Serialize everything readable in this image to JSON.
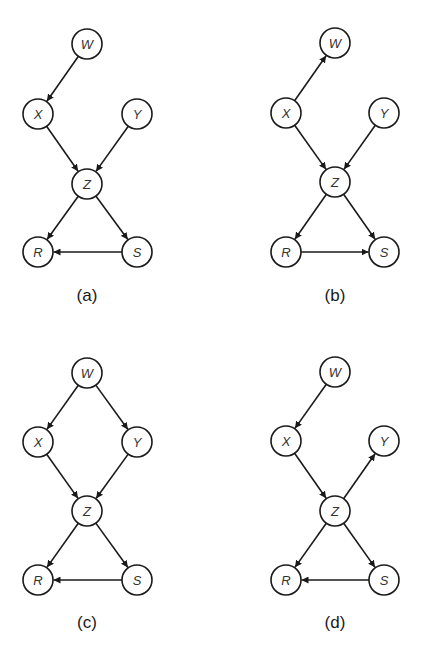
{
  "figure": {
    "node_radius": 15,
    "stroke_color": "#1a1a1a",
    "panels": [
      {
        "label": "(a)",
        "label_pos": [
          87,
          295
        ],
        "nodes": [
          {
            "id": "W",
            "label": "W",
            "x": 87,
            "y": 44
          },
          {
            "id": "X",
            "label": "X",
            "x": 38,
            "y": 114
          },
          {
            "id": "Y",
            "label": "Y",
            "x": 137,
            "y": 114
          },
          {
            "id": "Z",
            "label": "Z",
            "x": 87,
            "y": 184
          },
          {
            "id": "R",
            "label": "R",
            "x": 38,
            "y": 252
          },
          {
            "id": "S",
            "label": "S",
            "x": 137,
            "y": 252
          }
        ],
        "edges": [
          {
            "from": "W",
            "to": "X"
          },
          {
            "from": "X",
            "to": "Z"
          },
          {
            "from": "Y",
            "to": "Z"
          },
          {
            "from": "Z",
            "to": "R"
          },
          {
            "from": "Z",
            "to": "S"
          },
          {
            "from": "S",
            "to": "R"
          }
        ]
      },
      {
        "label": "(b)",
        "label_pos": [
          335,
          295
        ],
        "nodes": [
          {
            "id": "W",
            "label": "W",
            "x": 335,
            "y": 43
          },
          {
            "id": "X",
            "label": "X",
            "x": 286,
            "y": 113
          },
          {
            "id": "Y",
            "label": "Y",
            "x": 384,
            "y": 113
          },
          {
            "id": "Z",
            "label": "Z",
            "x": 335,
            "y": 182
          },
          {
            "id": "R",
            "label": "R",
            "x": 286,
            "y": 252
          },
          {
            "id": "S",
            "label": "S",
            "x": 384,
            "y": 252
          }
        ],
        "edges": [
          {
            "from": "X",
            "to": "W"
          },
          {
            "from": "X",
            "to": "Z"
          },
          {
            "from": "Y",
            "to": "Z"
          },
          {
            "from": "Z",
            "to": "R"
          },
          {
            "from": "Z",
            "to": "S"
          },
          {
            "from": "R",
            "to": "S"
          }
        ]
      },
      {
        "label": "(c)",
        "label_pos": [
          87,
          622
        ],
        "nodes": [
          {
            "id": "W",
            "label": "W",
            "x": 87,
            "y": 373
          },
          {
            "id": "X",
            "label": "X",
            "x": 38,
            "y": 442
          },
          {
            "id": "Y",
            "label": "Y",
            "x": 137,
            "y": 442
          },
          {
            "id": "Z",
            "label": "Z",
            "x": 87,
            "y": 511
          },
          {
            "id": "R",
            "label": "R",
            "x": 38,
            "y": 580
          },
          {
            "id": "S",
            "label": "S",
            "x": 137,
            "y": 580
          }
        ],
        "edges": [
          {
            "from": "W",
            "to": "X"
          },
          {
            "from": "W",
            "to": "Y"
          },
          {
            "from": "X",
            "to": "Z"
          },
          {
            "from": "Y",
            "to": "Z"
          },
          {
            "from": "Z",
            "to": "R"
          },
          {
            "from": "Z",
            "to": "S"
          },
          {
            "from": "S",
            "to": "R"
          }
        ]
      },
      {
        "label": "(d)",
        "label_pos": [
          335,
          622
        ],
        "nodes": [
          {
            "id": "W",
            "label": "W",
            "x": 335,
            "y": 372
          },
          {
            "id": "X",
            "label": "X",
            "x": 286,
            "y": 441
          },
          {
            "id": "Y",
            "label": "Y",
            "x": 384,
            "y": 441
          },
          {
            "id": "Z",
            "label": "Z",
            "x": 335,
            "y": 511
          },
          {
            "id": "R",
            "label": "R",
            "x": 286,
            "y": 580
          },
          {
            "id": "S",
            "label": "S",
            "x": 384,
            "y": 580
          }
        ],
        "edges": [
          {
            "from": "W",
            "to": "X"
          },
          {
            "from": "X",
            "to": "Z"
          },
          {
            "from": "Z",
            "to": "Y"
          },
          {
            "from": "Z",
            "to": "R"
          },
          {
            "from": "Z",
            "to": "S"
          },
          {
            "from": "S",
            "to": "R"
          }
        ]
      }
    ]
  }
}
